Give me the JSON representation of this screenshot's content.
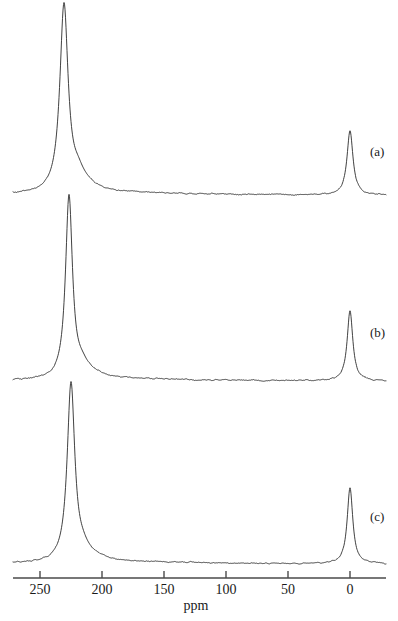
{
  "figure": {
    "type": "nmr-spectra-stack",
    "background_color": "#ffffff",
    "trace_color": "#2b2b2b",
    "axis_color": "#4a4a4a"
  },
  "axis": {
    "title": "ppm",
    "ticks": [
      {
        "label": "250",
        "value": 250
      },
      {
        "label": "200",
        "value": 200
      },
      {
        "label": "150",
        "value": 150
      },
      {
        "label": "100",
        "value": 100
      },
      {
        "label": "50",
        "value": 50
      },
      {
        "label": "0",
        "value": 0
      }
    ],
    "range_ppm": [
      273,
      25
    ],
    "direction": "decreasing-left-to-right",
    "line_y": 578,
    "px_per_ppm": 1.24,
    "x_at_zero_ppm": 350
  },
  "traces": [
    {
      "label": "(a)",
      "label_x": 370,
      "label_y": 144,
      "baseline_y": 195,
      "peaks": [
        {
          "ppm": 232,
          "x": 64,
          "apex_y": 8,
          "height": 187,
          "half_width_px": 5.0,
          "name": "carbene-carbon"
        },
        {
          "ppm": 0,
          "x": 350,
          "apex_y": 131,
          "height": 64,
          "half_width_px": 3.6,
          "name": "reference"
        }
      ],
      "shoulder": {
        "ppm": 220,
        "x": 78,
        "height": 12
      }
    },
    {
      "label": "(b)",
      "label_x": 370,
      "label_y": 325,
      "baseline_y": 381,
      "peaks": [
        {
          "ppm": 228,
          "x": 69,
          "apex_y": 199,
          "height": 182,
          "half_width_px": 4.2,
          "name": "carbene-carbon"
        },
        {
          "ppm": 0,
          "x": 350,
          "apex_y": 311,
          "height": 70,
          "half_width_px": 3.4,
          "name": "reference"
        }
      ],
      "shoulder": {
        "ppm": 218,
        "x": 82,
        "height": 9
      }
    },
    {
      "label": "(c)",
      "label_x": 370,
      "label_y": 509,
      "baseline_y": 564,
      "peaks": [
        {
          "ppm": 227,
          "x": 71,
          "apex_y": 386,
          "height": 178,
          "half_width_px": 4.6,
          "name": "carbene-carbon"
        },
        {
          "ppm": 0,
          "x": 350,
          "apex_y": 488,
          "height": 76,
          "half_width_px": 3.4,
          "name": "reference"
        }
      ],
      "shoulder": {
        "ppm": 217,
        "x": 83,
        "height": 8
      }
    }
  ],
  "chart_data": {
    "type": "line",
    "title": "",
    "xlabel": "ppm",
    "ylabel": "",
    "xlim": [
      273,
      25
    ],
    "grid": false,
    "legend": "none",
    "axis_inverted": true,
    "tick_values": [
      250,
      200,
      150,
      100,
      50,
      0
    ],
    "tick_labels": [
      "250",
      "200",
      "150",
      "100",
      "50",
      "0"
    ],
    "series": [
      {
        "name": "(a)",
        "annotation": "(a)",
        "peaks_ppm": [
          232,
          0
        ],
        "peaks_relative_intensity": [
          1.0,
          0.34
        ],
        "baseline_noise": "low"
      },
      {
        "name": "(b)",
        "annotation": "(b)",
        "peaks_ppm": [
          228,
          0
        ],
        "peaks_relative_intensity": [
          1.0,
          0.38
        ],
        "baseline_noise": "low"
      },
      {
        "name": "(c)",
        "annotation": "(c)",
        "peaks_ppm": [
          227,
          0
        ],
        "peaks_relative_intensity": [
          1.0,
          0.43
        ],
        "baseline_noise": "moderate"
      }
    ]
  }
}
